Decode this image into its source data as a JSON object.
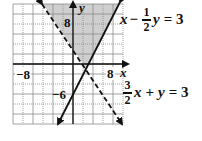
{
  "chart_data": {
    "type": "line",
    "title": "",
    "xlabel": "x",
    "ylabel": "y",
    "xlim": [
      -12,
      10
    ],
    "ylim": [
      -12,
      12
    ],
    "grid": true,
    "grid_step": 2,
    "tick_labels": {
      "x": [
        "-8",
        "8"
      ],
      "y": [
        "8",
        "-6"
      ]
    },
    "series": [
      {
        "name": "x - 1/2 y = 3",
        "style": "solid",
        "points": [
          [
            -4.5,
            -12
          ],
          [
            9,
            12
          ]
        ]
      },
      {
        "name": "3/2 x + y = 3",
        "style": "dashed",
        "points": [
          [
            -6,
            12
          ],
          [
            10,
            -12
          ]
        ]
      }
    ],
    "shaded_region": {
      "description": "Region satisfying x - 1/2 y <= 3 and 3/2 x + y > 3 (wedge above intersection)",
      "vertices": [
        [
          2.57,
          -0.86
        ],
        [
          9,
          12
        ],
        [
          -6,
          12
        ]
      ],
      "color": "#cfcfcf"
    },
    "intersection": [
      2.57,
      -0.86
    ],
    "annotations": [
      "x − ½y = 3",
      "³⁄₂x + y = 3"
    ]
  },
  "labels": {
    "x_axis": "x",
    "y_axis": "y",
    "x_neg": "−8",
    "x_pos": "8",
    "y_pos": "8",
    "y_neg": "−6"
  },
  "equations": {
    "eq1": {
      "var1": "x",
      "op": "−",
      "num": "1",
      "den": "2",
      "var2": "y",
      "rhs": "= 3"
    },
    "eq2": {
      "num": "3",
      "den": "2",
      "var1": "x",
      "op": "+",
      "var2": "y",
      "rhs": "= 3"
    }
  },
  "colors": {
    "shade": "#cfcfcf",
    "grid": "#8a8a8a",
    "line": "#111111"
  }
}
